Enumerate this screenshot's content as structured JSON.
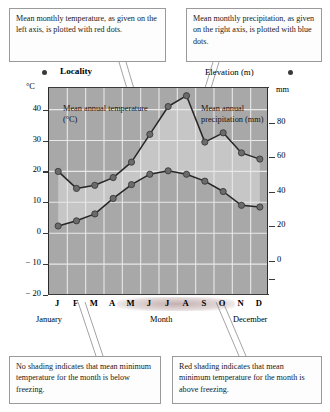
{
  "callouts": {
    "temperature": "Mean monthly temperature, as given on the left axis, is plotted with red dots.",
    "precipitation": "Mean monthly precipitation, as given on the right axis, is plotted with blue dots.",
    "no_shading": "No shading indicates that mean minimum temperature for the month is below freezing.",
    "red_shading": "Red shading indicates that mean minimum temperature for the month is above freezing."
  },
  "header": {
    "locality_label": "Locality",
    "elevation_label": "Elevation (m)",
    "left_unit": "°C",
    "right_unit": "mm",
    "left_dot_icon": "red-dot",
    "right_dot_icon": "blue-dot"
  },
  "annotations": {
    "temperature_series": "Mean annual temperature (°C)",
    "precipitation_series": "Mean annual precipitation (mm)"
  },
  "axis_captions": {
    "january": "January",
    "month": "Month",
    "december": "December"
  },
  "colors": {
    "plot_background": "#a8a8a8",
    "band_fill": "#c6c6c6",
    "gridline": "#e8e8e8",
    "marker": "#6b6b6b",
    "line": "#262626",
    "axis": "#2b2b2b",
    "red_shading": "#9c6a6a",
    "box_border": "#9a9a9a"
  },
  "chart_data": {
    "type": "line",
    "title": "",
    "subtitle": "",
    "xlabel": "Month",
    "categories": [
      "J",
      "F",
      "M",
      "A",
      "M",
      "J",
      "J",
      "A",
      "S",
      "O",
      "N",
      "D"
    ],
    "month_names": [
      "January",
      "February",
      "March",
      "April",
      "May",
      "June",
      "July",
      "August",
      "September",
      "October",
      "November",
      "December"
    ],
    "grid": true,
    "legend": "none",
    "axes": {
      "left": {
        "label": "°C",
        "ticks": [
          40,
          30,
          20,
          10,
          0,
          -10,
          -20
        ],
        "tick_labels": [
          "40",
          "30",
          "20",
          "10",
          "0",
          "− 10",
          "− 20"
        ],
        "range": [
          -20,
          47
        ]
      },
      "right": {
        "label": "mm",
        "ticks": [
          80,
          60,
          40,
          20,
          0
        ],
        "tick_labels": [
          "80",
          "60",
          "40",
          "20",
          "0"
        ],
        "range": [
          -20,
          100
        ]
      }
    },
    "series": [
      {
        "name": "Mean annual temperature (°C)",
        "axis": "left",
        "unit": "°C",
        "marker": "red-dot",
        "values": [
          20,
          14.5,
          15.5,
          18,
          23,
          32,
          41,
          44.5,
          29.5,
          32.5,
          26,
          24
        ]
      },
      {
        "name": "Mean annual precipitation (mm)",
        "axis": "right",
        "unit": "mm",
        "marker": "blue-dot",
        "values": [
          20,
          23,
          27,
          36,
          44,
          50,
          52,
          50,
          46,
          40,
          32,
          31
        ]
      }
    ],
    "highlighted_months": [
      "M",
      "J",
      "J",
      "A",
      "S",
      "O"
    ],
    "highlight_meaning": "Red shading indicates that mean minimum temperature for the month is above freezing."
  }
}
